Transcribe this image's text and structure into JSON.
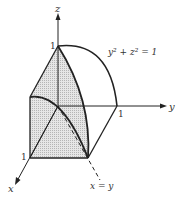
{
  "figure": {
    "axes": {
      "x_label": "x",
      "y_label": "y",
      "z_label": "z"
    },
    "ticks": {
      "x_one": "1",
      "y_one": "1",
      "z_one": "1"
    },
    "annotations": {
      "cylinder_equation": "y² + z² = 1",
      "diagonal_label": "x = y"
    },
    "colors": {
      "ink": "#222222",
      "shade": "#d9d9d9",
      "background": "#ffffff"
    }
  }
}
